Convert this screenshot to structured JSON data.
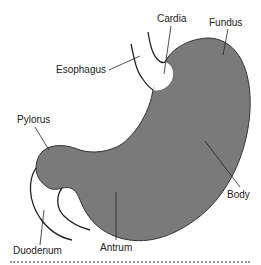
{
  "diagram": {
    "colors": {
      "stomach_fill": "#7a7a7a",
      "outline": "#333333",
      "label_text": "#222222",
      "background": "#ffffff"
    },
    "labels": {
      "cardia": "Cardia",
      "fundus": "Fundus",
      "esophagus": "Esophagus",
      "pylorus": "Pylorus",
      "body": "Body",
      "duodenum": "Duodenum",
      "antrum": "Antrum"
    }
  }
}
